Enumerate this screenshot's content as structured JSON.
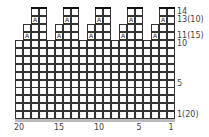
{
  "chart": {
    "columns": 20,
    "rows": 14,
    "groups": 5,
    "group_width": 4,
    "symbol": "A",
    "row_labels": [
      {
        "row": 14,
        "text": "14"
      },
      {
        "row": 13,
        "text": "13(10)"
      },
      {
        "row": 11,
        "text": "11(15)"
      },
      {
        "row": 10,
        "text": "10"
      },
      {
        "row": 5,
        "text": "5"
      },
      {
        "row": 1,
        "text": "1(20)"
      }
    ],
    "column_labels": [
      {
        "col": 20,
        "text": "20"
      },
      {
        "col": 15,
        "text": "15"
      },
      {
        "col": 10,
        "text": "10"
      },
      {
        "col": 5,
        "text": "5"
      },
      {
        "col": 1,
        "text": "1"
      }
    ],
    "shape": {
      "rows_1_10": "all columns",
      "rows_11_12": "columns 2-4 of each group",
      "rows_13_14": "columns 3-4 of each group",
      "symbol_cells": [
        {
          "row": 11,
          "group_col": 2
        },
        {
          "row": 13,
          "group_col": 3
        }
      ]
    }
  }
}
